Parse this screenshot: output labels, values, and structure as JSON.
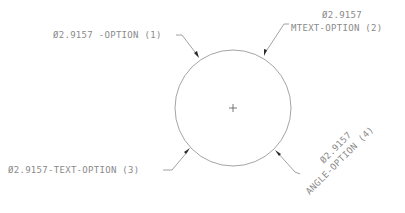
{
  "drawing": {
    "circle": {
      "cx": 233,
      "cy": 108,
      "r": 58
    },
    "colors": {
      "text": "#8a8a8a",
      "lines": "#9a9a9a",
      "arrowheads": "#2a2a2a"
    },
    "dimensions": [
      {
        "id": 1,
        "text": "Ø2.9157 -OPTION (1)"
      },
      {
        "id": 2,
        "line1": "Ø2.9157",
        "line2": "MTEXT-OPTION (2)"
      },
      {
        "id": 3,
        "text": "Ø2.9157-TEXT-OPTION (3)"
      },
      {
        "id": 4,
        "line1": "Ø2.9157",
        "line2": "ANGLE-OPTION (4)",
        "rotation_deg": -45
      }
    ]
  }
}
